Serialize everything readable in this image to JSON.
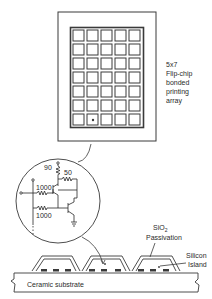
{
  "diagram": {
    "array_label": {
      "lines": [
        "5x7",
        "Flip-chip",
        "bonded",
        "printing",
        "array"
      ]
    },
    "grid": {
      "columns": 5,
      "rows": 7
    },
    "circuit": {
      "resistor_top": "90",
      "resistor_collector": "50",
      "resistor_base_1": "1000",
      "resistor_base_2": "1000"
    },
    "cross_section": {
      "passivation_label_main": "SiO",
      "passivation_label_sub": "2",
      "passivation_label_line2": "Passivation",
      "island_label_line1": "Silicon",
      "island_label_line2": "Island",
      "substrate_label": "Ceramic substrate"
    },
    "colors": {
      "line": "#3a3a3a",
      "background": "#ffffff"
    }
  }
}
